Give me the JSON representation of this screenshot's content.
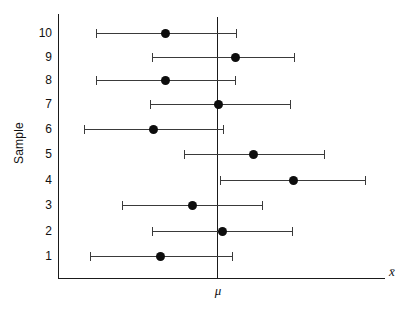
{
  "chart_data": {
    "type": "scatter",
    "title": "",
    "subtitle": "",
    "xlabel": "x̄",
    "ylabel": "Sample",
    "grid": false,
    "legend": "none",
    "reference_line": {
      "label": "μ",
      "value": 0,
      "orientation": "vertical"
    },
    "xlim": [
      -4.2,
      6.2
    ],
    "ylim": [
      0.4,
      10.6
    ],
    "categories": [
      "1",
      "2",
      "3",
      "4",
      "5",
      "6",
      "7",
      "8",
      "9",
      "10"
    ],
    "series": [
      {
        "name": "Confidence intervals",
        "points": [
          {
            "sample": 1,
            "lower": -3.05,
            "mean": -1.25,
            "upper": 0.55,
            "contains_mu": true
          },
          {
            "sample": 2,
            "lower": -1.45,
            "mean": 0.15,
            "upper": 1.95,
            "contains_mu": true
          },
          {
            "sample": 3,
            "lower": -2.2,
            "mean": -0.6,
            "upper": 1.2,
            "contains_mu": true
          },
          {
            "sample": 4,
            "lower": 0.1,
            "mean": 1.95,
            "upper": 3.8,
            "contains_mu": false
          },
          {
            "sample": 5,
            "lower": -0.75,
            "mean": 0.95,
            "upper": 2.75,
            "contains_mu": true
          },
          {
            "sample": 6,
            "lower": -3.25,
            "mean": -1.6,
            "upper": 0.15,
            "contains_mu": true
          },
          {
            "sample": 7,
            "lower": -1.5,
            "mean": 0.0,
            "upper": 1.8,
            "contains_mu": true
          },
          {
            "sample": 8,
            "lower": -2.9,
            "mean": -1.2,
            "upper": 0.45,
            "contains_mu": true
          },
          {
            "sample": 9,
            "lower": -1.5,
            "mean": 0.45,
            "upper": 1.95,
            "contains_mu": true
          },
          {
            "sample": 10,
            "lower": -2.9,
            "mean": -1.2,
            "upper": 0.5,
            "contains_mu": true
          }
        ]
      }
    ],
    "pixel_geometry": {
      "mu_x": 217,
      "rows": [
        {
          "sample": 10,
          "y": 33,
          "left": 96,
          "dot": 165,
          "right": 236
        },
        {
          "sample": 9,
          "y": 57,
          "left": 152,
          "dot": 235,
          "right": 294
        },
        {
          "sample": 8,
          "y": 80,
          "left": 96,
          "dot": 165,
          "right": 235
        },
        {
          "sample": 7,
          "y": 104,
          "left": 150,
          "dot": 218,
          "right": 290
        },
        {
          "sample": 6,
          "y": 129,
          "left": 84,
          "dot": 153,
          "right": 223
        },
        {
          "sample": 5,
          "y": 154,
          "left": 184,
          "dot": 253,
          "right": 324
        },
        {
          "sample": 4,
          "y": 180,
          "left": 220,
          "dot": 293,
          "right": 365
        },
        {
          "sample": 3,
          "y": 205,
          "left": 122,
          "dot": 192,
          "right": 262
        },
        {
          "sample": 2,
          "y": 231,
          "left": 152,
          "dot": 222,
          "right": 292
        },
        {
          "sample": 1,
          "y": 256,
          "left": 90,
          "dot": 160,
          "right": 232
        }
      ]
    },
    "colors": {
      "axis": "#1a1a1a",
      "interval": "#3a3a3a",
      "marker": "#0d0d0d",
      "background": "#ffffff"
    }
  }
}
